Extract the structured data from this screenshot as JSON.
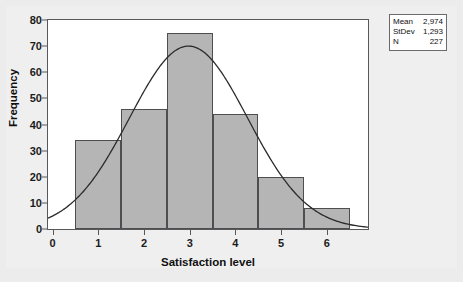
{
  "chart_data": {
    "type": "bar",
    "title": "",
    "subtitle": "",
    "xlabel": "Satisfaction level",
    "ylabel": "Frequency",
    "categories": [
      "1",
      "2",
      "3",
      "4",
      "5",
      "6"
    ],
    "values": [
      34,
      46,
      75,
      44,
      20,
      8
    ],
    "bin_edges": [
      0.5,
      1.5,
      2.5,
      3.5,
      4.5,
      5.5,
      6.5
    ],
    "xlim": [
      -0.1,
      6.9
    ],
    "ylim": [
      0,
      80
    ],
    "xticks": [
      0,
      1,
      2,
      3,
      4,
      5,
      6
    ],
    "yticks": [
      0,
      10,
      20,
      30,
      40,
      50,
      60,
      70,
      80
    ],
    "grid": false,
    "legend": "none",
    "bar_color": "#b5b5b5",
    "bar_edge_color": "#4e4e50",
    "curve_color": "#2b2b2b",
    "fit_curve": {
      "name": "normal",
      "mean": 2.974,
      "stdev": 1.293,
      "n": 227,
      "peak_value": 70,
      "description": "Normal distribution fit overlay"
    },
    "annotations": {
      "stats_rows": [
        {
          "key": "Mean",
          "value": "2,974"
        },
        {
          "key": "StDev",
          "value": "1,293"
        },
        {
          "key": "N",
          "value": "227"
        }
      ]
    }
  },
  "stats": {
    "rows": [
      {
        "key": "Mean",
        "value": "2,974"
      },
      {
        "key": "StDev",
        "value": "1,293"
      },
      {
        "key": "N",
        "value": "227"
      }
    ]
  },
  "axes": {
    "y_title": "Frequency",
    "x_title": "Satisfaction level"
  }
}
